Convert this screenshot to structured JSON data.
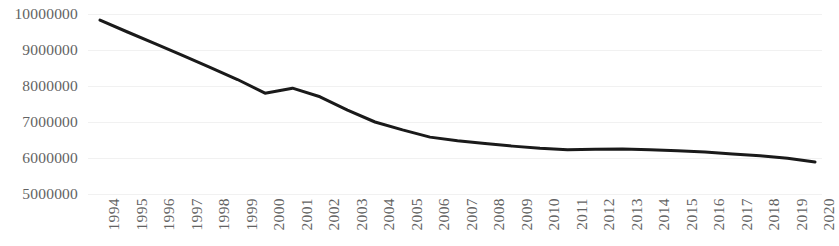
{
  "chart_data": {
    "type": "line",
    "title": "",
    "subtitle": "",
    "xlabel": "",
    "ylabel": "",
    "grid": true,
    "legend": "none",
    "xlim": [
      "1994",
      "2020"
    ],
    "ylim": [
      5000000,
      10000000
    ],
    "y_ticks": [
      10000000,
      9000000,
      8000000,
      7000000,
      6000000,
      5000000
    ],
    "y_tick_labels": [
      "10000000",
      "9000000",
      "8000000",
      "7000000",
      "6000000",
      "5000000"
    ],
    "categories": [
      "1994",
      "1995",
      "1996",
      "1997",
      "1998",
      "1999",
      "2000",
      "2001",
      "2002",
      "2003",
      "2004",
      "2005",
      "2006",
      "2007",
      "2008",
      "2009",
      "2010",
      "2011",
      "2012",
      "2013",
      "2014",
      "2015",
      "2016",
      "2017",
      "2018",
      "2019",
      "2020"
    ],
    "series": [
      {
        "name": "",
        "color": "#1a1a1a",
        "line_width": 3,
        "values": [
          9830000,
          9500000,
          9180000,
          8850000,
          8520000,
          8180000,
          7800000,
          7940000,
          7700000,
          7330000,
          7000000,
          6780000,
          6580000,
          6480000,
          6400000,
          6330000,
          6270000,
          6230000,
          6240000,
          6250000,
          6230000,
          6200000,
          6170000,
          6110000,
          6060000,
          5990000,
          5890000
        ]
      }
    ]
  },
  "axis_style": {
    "tick_label_color": "#636363",
    "gridline_color": "#f1f1f1",
    "background": "#ffffff"
  }
}
